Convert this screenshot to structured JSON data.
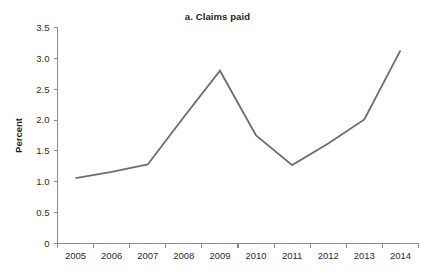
{
  "chart_data": {
    "type": "line",
    "title": "a. Claims paid",
    "xlabel": "",
    "ylabel": "Percent",
    "categories": [
      "2005",
      "2006",
      "2007",
      "2008",
      "2009",
      "2010",
      "2011",
      "2012",
      "2013",
      "2014"
    ],
    "x": [
      2005,
      2006,
      2007,
      2008,
      2009,
      2010,
      2011,
      2012,
      2013,
      2014
    ],
    "series": [
      {
        "name": "Claims paid",
        "values": [
          1.06,
          1.16,
          1.28,
          2.05,
          2.8,
          1.75,
          1.27,
          1.62,
          2.01,
          3.13
        ]
      }
    ],
    "ylim": [
      0,
      3.5
    ],
    "y_ticks": [
      "0",
      "0.5",
      "1.0",
      "1.5",
      "2.0",
      "2.5",
      "3.0",
      "3.5"
    ],
    "y_tick_values": [
      0,
      0.5,
      1.0,
      1.5,
      2.0,
      2.5,
      3.0,
      3.5
    ],
    "grid": false,
    "legend": "none",
    "line_color": "#6f6f6f",
    "axis_color": "#8c8c8c",
    "background_color": "#ffffff"
  }
}
